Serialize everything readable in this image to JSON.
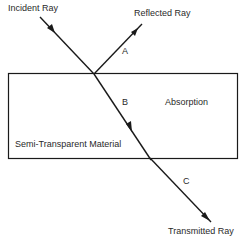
{
  "diagram": {
    "labels": {
      "incident": "Incident Ray",
      "reflected": "Reflected Ray",
      "transmitted": "Transmitted Ray",
      "absorption": "Absorption",
      "material": "Semi-Transparent Material",
      "a": "A",
      "b": "B",
      "c": "C"
    },
    "colors": {
      "line": "#1a1a1a",
      "text": "#2a2a2a",
      "background": "#ffffff"
    }
  }
}
